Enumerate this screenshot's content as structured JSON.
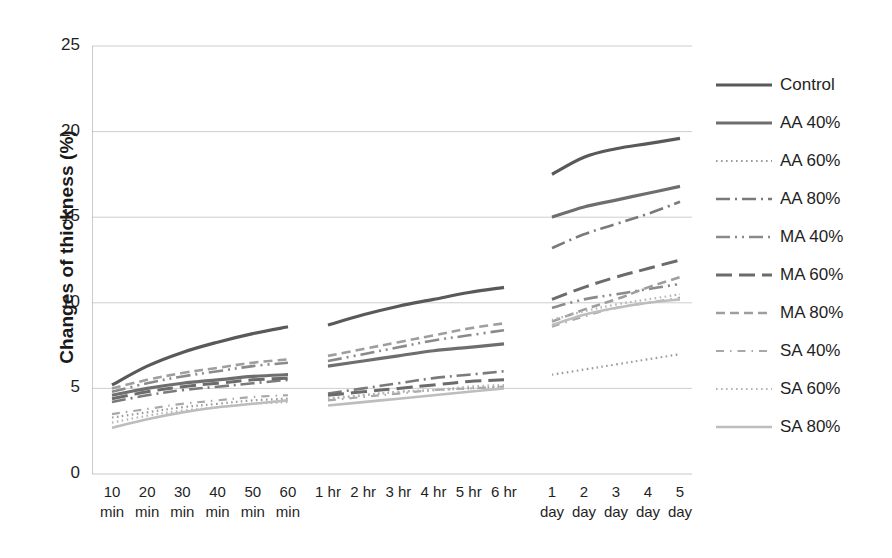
{
  "chart_data": {
    "type": "line",
    "title": "",
    "subtitle": "",
    "xlabel": "",
    "ylabel": "Changes of thickness (%)",
    "ylim": [
      0,
      25
    ],
    "yticks": [
      0,
      5,
      10,
      15,
      20,
      25
    ],
    "grid": true,
    "legend_position": "right",
    "x_segments": [
      {
        "name": "minutes",
        "categories": [
          "10 min",
          "20 min",
          "30 min",
          "40 min",
          "50 min",
          "60 min"
        ],
        "tick_line1": [
          "10",
          "20",
          "30",
          "40",
          "50",
          "60"
        ],
        "tick_line2": [
          "min",
          "min",
          "min",
          "min",
          "min",
          "min"
        ]
      },
      {
        "name": "hours",
        "categories": [
          "1 hr",
          "2 hr",
          "3 hr",
          "4 hr",
          "5 hr",
          "6 hr"
        ],
        "tick_line1": [
          "1 hr",
          "2 hr",
          "3 hr",
          "4 hr",
          "5 hr",
          "6 hr"
        ],
        "tick_line2": [
          "",
          "",
          "",
          "",
          "",
          ""
        ]
      },
      {
        "name": "days",
        "categories": [
          "1 day",
          "2 day",
          "3 day",
          "4 day",
          "5 day"
        ],
        "tick_line1": [
          "1",
          "2",
          "3",
          "4",
          "5"
        ],
        "tick_line2": [
          "day",
          "day",
          "day",
          "day",
          "day"
        ]
      }
    ],
    "categories": [
      "10 min",
      "20 min",
      "30 min",
      "40 min",
      "50 min",
      "60 min",
      "1 hr",
      "2 hr",
      "3 hr",
      "4 hr",
      "5 hr",
      "6 hr",
      "1 day",
      "2 day",
      "3 day",
      "4 day",
      "5 day"
    ],
    "series": [
      {
        "name": "Control",
        "color": "#595959",
        "dash": "none",
        "width": 3.2,
        "values": [
          5.2,
          6.3,
          7.1,
          7.7,
          8.2,
          8.6,
          8.7,
          9.3,
          9.8,
          10.2,
          10.6,
          10.9,
          17.5,
          18.5,
          19.0,
          19.3,
          19.6
        ]
      },
      {
        "name": "AA 40%",
        "color": "#6e6e6e",
        "dash": "none",
        "width": 3.2,
        "values": [
          4.6,
          5.0,
          5.3,
          5.5,
          5.7,
          5.8,
          6.3,
          6.6,
          6.9,
          7.2,
          7.4,
          7.6,
          15.0,
          15.6,
          16.0,
          16.4,
          16.8
        ]
      },
      {
        "name": "AA 60%",
        "color": "#9b9b9b",
        "dash": "dotted",
        "width": 2.2,
        "values": [
          3.3,
          3.6,
          3.9,
          4.1,
          4.3,
          4.4,
          4.4,
          4.6,
          4.8,
          4.9,
          5.0,
          5.1,
          5.8,
          6.1,
          6.4,
          6.7,
          7.0
        ]
      },
      {
        "name": "AA 80%",
        "color": "#7a7a7a",
        "dash": "dashdot",
        "width": 2.6,
        "values": [
          4.2,
          4.6,
          4.9,
          5.1,
          5.3,
          5.5,
          4.7,
          5.0,
          5.3,
          5.6,
          5.8,
          6.0,
          13.2,
          14.0,
          14.6,
          15.2,
          15.9
        ]
      },
      {
        "name": "MA 40%",
        "color": "#8a8a8a",
        "dash": "dashdotdot",
        "width": 2.6,
        "values": [
          4.8,
          5.3,
          5.7,
          6.0,
          6.3,
          6.5,
          6.6,
          7.0,
          7.4,
          7.8,
          8.1,
          8.4,
          9.7,
          10.2,
          10.5,
          10.8,
          11.1
        ]
      },
      {
        "name": "MA 60%",
        "color": "#6b6b6b",
        "dash": "longdash",
        "width": 3.0,
        "values": [
          4.4,
          4.8,
          5.1,
          5.3,
          5.5,
          5.6,
          4.6,
          4.8,
          5.0,
          5.2,
          5.4,
          5.5,
          10.2,
          10.9,
          11.5,
          12.0,
          12.5
        ]
      },
      {
        "name": "MA 80%",
        "color": "#9e9e9e",
        "dash": "dashed",
        "width": 2.6,
        "values": [
          5.0,
          5.5,
          5.9,
          6.2,
          6.5,
          6.7,
          6.9,
          7.3,
          7.7,
          8.1,
          8.5,
          8.8,
          8.9,
          9.6,
          10.2,
          10.9,
          11.5
        ]
      },
      {
        "name": "SA 40%",
        "color": "#a8a8a8",
        "dash": "sparsedashdot",
        "width": 2.2,
        "values": [
          3.5,
          3.8,
          4.1,
          4.3,
          4.5,
          4.6,
          4.3,
          4.5,
          4.7,
          4.9,
          5.0,
          5.1,
          8.6,
          9.2,
          9.7,
          10.0,
          10.3
        ]
      },
      {
        "name": "SA 60%",
        "color": "#b5b5b5",
        "dash": "dotted",
        "width": 2.2,
        "values": [
          3.0,
          3.4,
          3.7,
          3.9,
          4.1,
          4.2,
          4.4,
          4.6,
          4.8,
          4.9,
          5.1,
          5.2,
          9.0,
          9.5,
          9.9,
          10.2,
          10.5
        ]
      },
      {
        "name": "SA 80%",
        "color": "#bdbdbd",
        "dash": "none",
        "width": 2.6,
        "values": [
          2.7,
          3.2,
          3.6,
          3.9,
          4.1,
          4.3,
          4.0,
          4.2,
          4.4,
          4.6,
          4.8,
          5.0,
          8.7,
          9.3,
          9.7,
          10.0,
          10.2
        ]
      }
    ]
  },
  "axis": {
    "y_title": "Changes of thickness (%)",
    "y_ticks": [
      "25",
      "20",
      "15",
      "10",
      "5",
      "0"
    ]
  },
  "legend": {
    "items": [
      {
        "label": "Control"
      },
      {
        "label": "AA 40%"
      },
      {
        "label": "AA 60%"
      },
      {
        "label": "AA 80%"
      },
      {
        "label": "MA 40%"
      },
      {
        "label": "MA 60%"
      },
      {
        "label": "MA 80%"
      },
      {
        "label": "SA 40%"
      },
      {
        "label": "SA 60%"
      },
      {
        "label": "SA 80%"
      }
    ]
  },
  "colors": {
    "gridline": "#c8c8c8",
    "axis": "#aaaaaa",
    "text": "#1f1f1f",
    "background": "#ffffff"
  }
}
